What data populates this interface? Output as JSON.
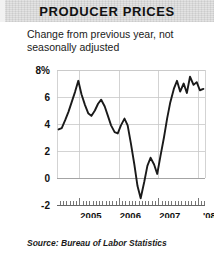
{
  "header": {
    "title": "PRODUCER PRICES"
  },
  "subtitle": {
    "line1": "Change from previous year, not",
    "line2": "seasonally adjusted"
  },
  "source": {
    "text": "Source: Bureau of Labor Statistics"
  },
  "colors": {
    "header_background": "#e3e3e3",
    "line": "#1a1a1a",
    "grid": "#c8c8c8",
    "axis": "#555555",
    "text": "#111111",
    "page_background": "#ffffff"
  },
  "chart_data": {
    "type": "line",
    "title": "PRODUCER PRICES",
    "subtitle": "Change from previous year, not seasonally adjusted",
    "xlabel": "",
    "ylabel": "",
    "source": "Source: Bureau of Labor Statistics",
    "grid": true,
    "legend": "none",
    "ylim": [
      -2,
      8
    ],
    "yticks": [
      8,
      6,
      4,
      2,
      0,
      -2
    ],
    "ytick_labels": [
      "8%",
      "6",
      "4",
      "2",
      "0",
      "-2"
    ],
    "xlim": [
      2004.42,
      2008.17
    ],
    "xticks": [
      2005,
      2006,
      2007,
      2008
    ],
    "xtick_labels": [
      "2005",
      "2006",
      "2007",
      "'08"
    ],
    "minor_tick_interval_months": 1,
    "series": [
      {
        "name": "Producer price index, change from previous year",
        "units": "percent",
        "x": [
          2004.46,
          2004.54,
          2004.63,
          2004.71,
          2004.79,
          2004.88,
          2004.96,
          2005.04,
          2005.13,
          2005.21,
          2005.29,
          2005.38,
          2005.46,
          2005.54,
          2005.63,
          2005.71,
          2005.79,
          2005.88,
          2005.96,
          2006.04,
          2006.13,
          2006.21,
          2006.29,
          2006.38,
          2006.46,
          2006.54,
          2006.63,
          2006.71,
          2006.79,
          2006.88,
          2006.96,
          2007.04,
          2007.13,
          2007.21,
          2007.29,
          2007.38,
          2007.46,
          2007.54,
          2007.63,
          2007.71,
          2007.79,
          2007.88,
          2007.96,
          2008.04,
          2008.13
        ],
        "y": [
          3.6,
          3.7,
          4.3,
          4.9,
          5.6,
          6.4,
          7.2,
          6.2,
          5.4,
          4.8,
          4.6,
          5.0,
          5.5,
          5.8,
          5.3,
          4.6,
          3.9,
          3.4,
          3.3,
          3.9,
          4.4,
          3.9,
          2.6,
          1.0,
          -0.6,
          -1.5,
          -0.3,
          0.9,
          1.5,
          1.0,
          0.3,
          1.6,
          3.0,
          4.4,
          5.6,
          6.6,
          7.2,
          6.4,
          7.0,
          6.3,
          7.5,
          6.9,
          7.1,
          6.5,
          6.6
        ]
      }
    ],
    "annotations": []
  }
}
